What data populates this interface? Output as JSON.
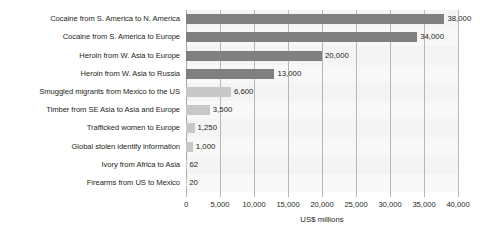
{
  "chart_data": {
    "type": "bar",
    "orientation": "horizontal",
    "title": "",
    "subtitle": "",
    "xlabel": "US$ millions",
    "ylabel": "",
    "xlim": [
      0,
      40000
    ],
    "grid": true,
    "legend": "none",
    "tick_labels": [
      "0",
      "5,000",
      "10,000",
      "15,000",
      "20,000",
      "25,000",
      "30,000",
      "35,000",
      "40,000"
    ],
    "tick_values": [
      0,
      5000,
      10000,
      15000,
      20000,
      25000,
      30000,
      35000,
      40000
    ],
    "categories": [
      "Cocaine from S. America to N. America",
      "Cocaine from S. America to Europe",
      "Heroin from W. Asia to Europe",
      "Heroin from W. Asia to Russia",
      "Smuggled migrants from Mexico to the US",
      "Timber from SE Asia to Asia and Europe",
      "Trafficked women to Europe",
      "Global stolen identify information",
      "Ivory from Africa to Asia",
      "Firearms from US to Mexico"
    ],
    "values": [
      38000,
      34000,
      20000,
      13000,
      6600,
      3500,
      1250,
      1000,
      62,
      20
    ],
    "value_labels": [
      "38,000",
      "34,000",
      "20,000",
      "13,000",
      "6,600",
      "3,500",
      "1,250",
      "1,000",
      "62",
      "20"
    ],
    "bar_colors": [
      "#808080",
      "#808080",
      "#808080",
      "#808080",
      "#c8c8c8",
      "#c8c8c8",
      "#c8c8c8",
      "#c8c8c8",
      "#c8c8c8",
      "#c8c8c8"
    ],
    "colors": {
      "dark_bar": "#808080",
      "light_bar": "#c8c8c8",
      "plot_background": "#f7f7f7",
      "gridline": "#b7b7b7",
      "text": "#231f20",
      "page_background": "#ffffff"
    }
  }
}
